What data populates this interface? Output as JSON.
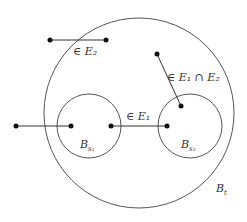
{
  "diagram": {
    "colors": {
      "stroke": "#555555",
      "dot": "#111111",
      "text": "#333333"
    },
    "outer_ball": {
      "label_base": "B",
      "label_sub": "t",
      "cx": 139,
      "cy": 113,
      "r": 95
    },
    "inner_balls": [
      {
        "label_base": "B",
        "label_sub": "s₁",
        "cx": 89,
        "cy": 126,
        "r": 32
      },
      {
        "label_base": "B",
        "label_sub": "s₂",
        "cx": 190,
        "cy": 126,
        "r": 32
      }
    ],
    "segments": [
      {
        "name": "top-segment",
        "x1": 50,
        "y1": 40,
        "x2": 106,
        "y2": 40,
        "label": "∈ E₂"
      },
      {
        "name": "left-segment",
        "x1": 16,
        "y1": 126,
        "x2": 71,
        "y2": 126,
        "label": ""
      },
      {
        "name": "middle-segment",
        "x1": 111,
        "y1": 126,
        "x2": 167,
        "y2": 126,
        "label": "∈ E₁"
      },
      {
        "name": "diagonal-segment",
        "x1": 157,
        "y1": 54,
        "x2": 181,
        "y2": 106,
        "label": "∈ E₁ ∩ E₂"
      }
    ],
    "labels": {
      "top_segment": "∈ E₂",
      "middle_segment": "∈ E₁",
      "diagonal_segment": "∈ E₁ ∩ E₂",
      "inner_ball_1": "B",
      "inner_ball_1_sub": "s₁",
      "inner_ball_2": "B",
      "inner_ball_2_sub": "s₂",
      "outer_ball": "B",
      "outer_ball_sub": "t"
    }
  }
}
